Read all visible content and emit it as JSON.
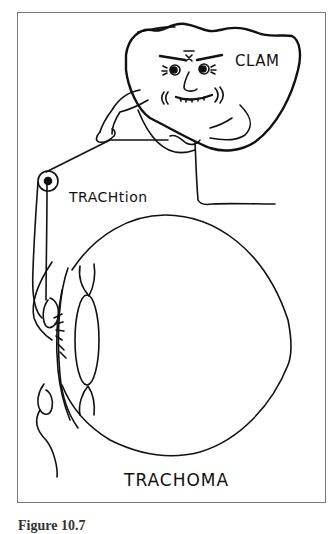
{
  "figure": {
    "labels": {
      "clam": "CLAM",
      "traction": "TRACHtion",
      "trachoma": "TRACHOMA"
    },
    "caption": "Figure 10.7"
  },
  "colors": {
    "ink": "#111111",
    "frame": "#7a7a7a",
    "background": "#ffffff"
  }
}
